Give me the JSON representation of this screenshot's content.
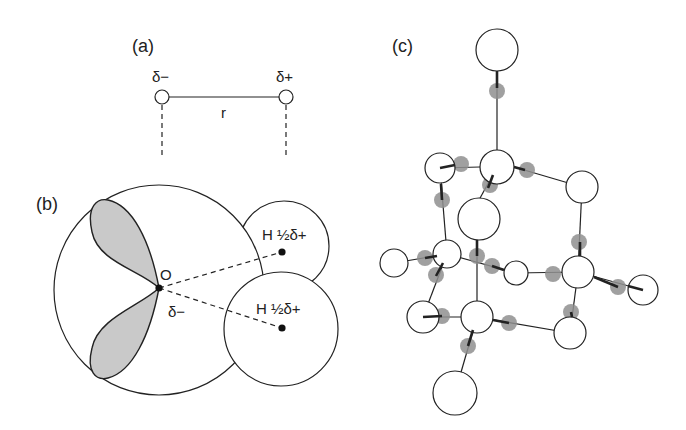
{
  "panels": {
    "a": {
      "label": "(a)",
      "left_charge": "δ−",
      "right_charge": "δ+",
      "distance_label": "r"
    },
    "b": {
      "label": "(b)",
      "oxygen_label": "O",
      "oxygen_charge": "δ−",
      "hydrogen_upper": "H ½δ+",
      "hydrogen_lower": "H ½δ+"
    },
    "c": {
      "label": "(c)"
    }
  },
  "colors": {
    "line": "#222222",
    "lobe_fill": "#c9c9c9",
    "lone_pair": "#8f8f8f",
    "background": "#ffffff"
  }
}
